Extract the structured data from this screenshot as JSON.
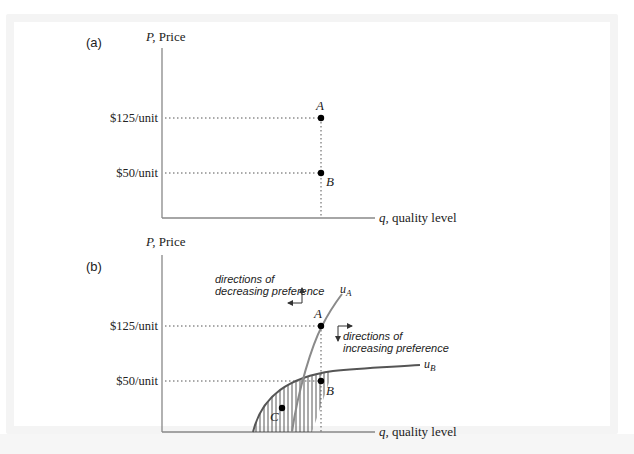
{
  "figure": {
    "panels": [
      {
        "id": "a",
        "label": "(a)",
        "y_axis_label_var": "P,",
        "y_axis_label": " Price",
        "x_axis_label_var": "q,",
        "x_axis_label": " quality level",
        "ticks": {
          "high": "$125/unit",
          "low": "$50/unit"
        },
        "points": {
          "A": "A",
          "B": "B"
        }
      },
      {
        "id": "b",
        "label": "(b)",
        "y_axis_label_var": "P,",
        "y_axis_label": " Price",
        "x_axis_label_var": "q,",
        "x_axis_label": " quality level",
        "ticks": {
          "high": "$125/unit",
          "low": "$50/unit"
        },
        "points": {
          "A": "A",
          "B": "B",
          "C": "C"
        },
        "curves": {
          "uA": "u",
          "uA_sub": "A",
          "uB": "u",
          "uB_sub": "B"
        },
        "annotations": {
          "decreasing_line1": "directions of",
          "decreasing_line2": "decreasing preference",
          "increasing_line1": "directions of",
          "increasing_line2": "increasing preference"
        }
      }
    ],
    "colors": {
      "axis": "#888888",
      "curve_uA": "#8a8a8a",
      "curve_uB": "#555555",
      "point": "#000000"
    }
  }
}
